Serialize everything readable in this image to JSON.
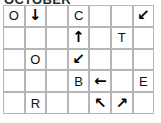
{
  "title": "OCTOBER",
  "grid": {
    "rows": 5,
    "columns": 7,
    "cells": [
      [
        {
          "name": "cell-r1c1",
          "kind": "letter",
          "value": "O"
        },
        {
          "name": "cell-r1c2",
          "kind": "arrow",
          "value": "↓",
          "icon": "arrow-down-icon"
        },
        {
          "name": "cell-r1c3",
          "kind": "empty",
          "value": ""
        },
        {
          "name": "cell-r1c4",
          "kind": "letter",
          "value": "C"
        },
        {
          "name": "cell-r1c5",
          "kind": "empty",
          "value": ""
        },
        {
          "name": "cell-r1c6",
          "kind": "empty",
          "value": ""
        },
        {
          "name": "cell-r1c7",
          "kind": "arrow",
          "value": "↙",
          "icon": "arrow-down-left-icon"
        }
      ],
      [
        {
          "name": "cell-r2c1",
          "kind": "empty",
          "value": ""
        },
        {
          "name": "cell-r2c2",
          "kind": "empty",
          "value": ""
        },
        {
          "name": "cell-r2c3",
          "kind": "empty",
          "value": ""
        },
        {
          "name": "cell-r2c4",
          "kind": "arrow",
          "value": "↑",
          "icon": "arrow-up-icon"
        },
        {
          "name": "cell-r2c5",
          "kind": "empty",
          "value": ""
        },
        {
          "name": "cell-r2c6",
          "kind": "letter",
          "value": "T"
        },
        {
          "name": "cell-r2c7",
          "kind": "empty",
          "value": ""
        }
      ],
      [
        {
          "name": "cell-r3c1",
          "kind": "empty",
          "value": ""
        },
        {
          "name": "cell-r3c2",
          "kind": "letter",
          "value": "O"
        },
        {
          "name": "cell-r3c3",
          "kind": "empty",
          "value": ""
        },
        {
          "name": "cell-r3c4",
          "kind": "arrow",
          "value": "↙",
          "icon": "arrow-down-left-icon"
        },
        {
          "name": "cell-r3c5",
          "kind": "empty",
          "value": ""
        },
        {
          "name": "cell-r3c6",
          "kind": "empty",
          "value": ""
        },
        {
          "name": "cell-r3c7",
          "kind": "empty",
          "value": ""
        }
      ],
      [
        {
          "name": "cell-r4c1",
          "kind": "empty",
          "value": ""
        },
        {
          "name": "cell-r4c2",
          "kind": "empty",
          "value": ""
        },
        {
          "name": "cell-r4c3",
          "kind": "empty",
          "value": ""
        },
        {
          "name": "cell-r4c4",
          "kind": "letter",
          "value": "B"
        },
        {
          "name": "cell-r4c5",
          "kind": "arrow",
          "value": "←",
          "icon": "arrow-left-icon"
        },
        {
          "name": "cell-r4c6",
          "kind": "empty",
          "value": ""
        },
        {
          "name": "cell-r4c7",
          "kind": "letter",
          "value": "E"
        }
      ],
      [
        {
          "name": "cell-r5c1",
          "kind": "empty",
          "value": ""
        },
        {
          "name": "cell-r5c2",
          "kind": "letter",
          "value": "R"
        },
        {
          "name": "cell-r5c3",
          "kind": "empty",
          "value": ""
        },
        {
          "name": "cell-r5c4",
          "kind": "empty",
          "value": ""
        },
        {
          "name": "cell-r5c5",
          "kind": "arrow",
          "value": "↖",
          "icon": "arrow-up-left-icon"
        },
        {
          "name": "cell-r5c6",
          "kind": "arrow",
          "value": "↗",
          "icon": "arrow-up-right-icon"
        },
        {
          "name": "cell-r5c7",
          "kind": "empty",
          "value": ""
        }
      ]
    ]
  },
  "colors": {
    "cell_border": "#b6b6b6",
    "cell_background": "#ffffff",
    "glyph": "#000000",
    "title": "#2b2b2b",
    "page_background": "#ffffff"
  }
}
